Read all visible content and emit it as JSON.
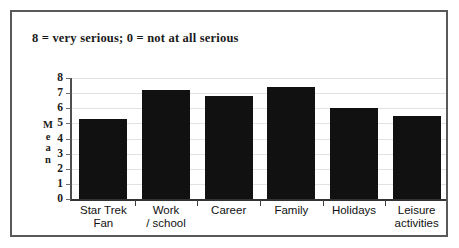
{
  "figure": {
    "caption": "8 = very serious; 0 = not at all serious",
    "border_color": "#595959",
    "background": "#ffffff"
  },
  "chart_data": {
    "type": "bar",
    "title": "8 = very serious; 0 = not at all serious",
    "xlabel": "",
    "ylabel": "Mean",
    "ylim": [
      0,
      8
    ],
    "yticks": [
      0,
      1,
      2,
      3,
      4,
      5,
      6,
      7,
      8
    ],
    "ytick_labels": [
      "0",
      "1",
      "2",
      "3",
      "4",
      "5",
      "6",
      "7",
      "8"
    ],
    "grid": true,
    "legend": "none",
    "bar_color": "#111111",
    "categories": [
      "Star Trek Fan",
      "Work / school",
      "Career",
      "Family",
      "Holidays",
      "Leisure activities"
    ],
    "category_lines": [
      [
        "Star Trek",
        "Fan"
      ],
      [
        "Work",
        "/ school"
      ],
      [
        "Career",
        ""
      ],
      [
        "Family",
        ""
      ],
      [
        "Holidays",
        ""
      ],
      [
        "Leisure",
        "activities"
      ]
    ],
    "values": [
      5.3,
      7.2,
      6.8,
      7.4,
      6.0,
      5.5
    ]
  },
  "axis": {
    "ylabel_letters": [
      "M",
      "e",
      "a",
      "n"
    ]
  }
}
